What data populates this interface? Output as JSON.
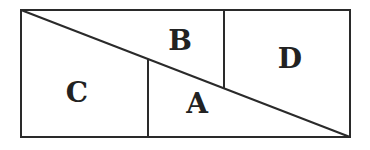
{
  "diagram": {
    "stroke_color": "#2a2a2a",
    "background": "#ffffff",
    "rectangle": {
      "x": 21,
      "y": 10,
      "width": 329,
      "height": 127
    },
    "diagonal": {
      "x1": 21,
      "y1": 10,
      "x2": 350,
      "y2": 137
    },
    "divider_left": {
      "x1": 148,
      "y1": 59,
      "x2": 148,
      "y2": 137
    },
    "divider_right": {
      "x1": 224,
      "y1": 10,
      "x2": 224,
      "y2": 88
    },
    "regions": [
      {
        "id": "A",
        "label": "A",
        "x": 197,
        "y": 113
      },
      {
        "id": "B",
        "label": "B",
        "x": 180,
        "y": 50
      },
      {
        "id": "C",
        "label": "C",
        "x": 77,
        "y": 102
      },
      {
        "id": "D",
        "label": "D",
        "x": 290,
        "y": 68
      }
    ]
  }
}
